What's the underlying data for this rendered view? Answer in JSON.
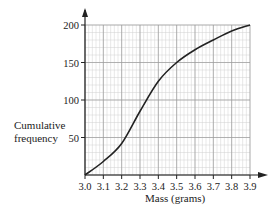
{
  "chart_data": {
    "type": "line",
    "title": "",
    "xlabel": "Mass (grams)",
    "ylabel": "Cumulative frequency",
    "x": [
      3.0,
      3.1,
      3.2,
      3.3,
      3.4,
      3.5,
      3.6,
      3.7,
      3.8,
      3.9
    ],
    "series": [
      {
        "name": "Cumulative frequency",
        "values": [
          0,
          18,
          42,
          85,
          125,
          150,
          167,
          180,
          192,
          200
        ]
      }
    ],
    "xlim": [
      3.0,
      3.9
    ],
    "ylim": [
      0,
      200
    ],
    "x_ticks": [
      "3.0",
      "3.1",
      "3.2",
      "3.3",
      "3.4",
      "3.5",
      "3.6",
      "3.7",
      "3.8",
      "3.9"
    ],
    "y_ticks": [
      "50",
      "100",
      "150",
      "200"
    ],
    "grid": true,
    "legend": "none",
    "colors": {
      "line": "#222222",
      "grid_major": "#9a9a9a",
      "grid_minor": "#d0d0d0"
    }
  },
  "labels": {
    "ylabel_line1": "Cumulative",
    "ylabel_line2": "frequency",
    "xlabel": "Mass (grams)"
  }
}
